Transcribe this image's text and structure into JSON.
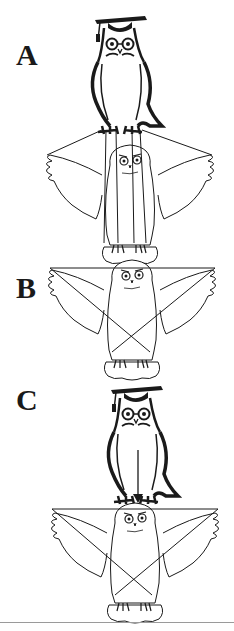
{
  "figure": {
    "panels": [
      {
        "label": "A",
        "description": "Graduate owl (mortarboard) perched, holding strings attached to wings and body of a lower owl like a puppet"
      },
      {
        "label": "B",
        "description": "Owl with strings crossing from wingtips to its own feet (self-controlled)"
      },
      {
        "label": "C",
        "description": "Graduate owl with arrow pointing down to an owl with crossed self-strings"
      }
    ],
    "colors": {
      "ink": "#1a1a1a",
      "background": "#ffffff",
      "rule": "#9a9a9a"
    }
  }
}
